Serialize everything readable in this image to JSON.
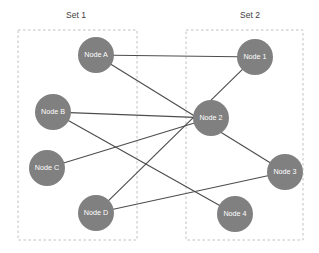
{
  "diagram": {
    "background_color": "#ffffff",
    "node_color": "#808080",
    "node_label_color": "#ffffff",
    "edge_color": "#4d4d4d",
    "box_border_color": "#c0c0c0",
    "set_label_color": "#404040"
  },
  "groups": [
    {
      "id": "set1",
      "label": "Set 1",
      "label_x": 76,
      "label_y": 16,
      "box": {
        "x": 18,
        "y": 30,
        "width": 119,
        "height": 210
      }
    },
    {
      "id": "set2",
      "label": "Set 2",
      "label_x": 250,
      "label_y": 16,
      "box": {
        "x": 186,
        "y": 30,
        "width": 117,
        "height": 210
      }
    }
  ],
  "nodes": [
    {
      "id": "A",
      "label": "Node A",
      "x": 96,
      "y": 55,
      "r": 18,
      "group": "set1"
    },
    {
      "id": "B",
      "label": "Node B",
      "x": 53,
      "y": 112,
      "r": 18,
      "group": "set1"
    },
    {
      "id": "C",
      "label": "Node C",
      "x": 47,
      "y": 168,
      "r": 18,
      "group": "set1"
    },
    {
      "id": "D",
      "label": "Node D",
      "x": 96,
      "y": 213,
      "r": 18,
      "group": "set1"
    },
    {
      "id": "1",
      "label": "Node 1",
      "x": 255,
      "y": 57,
      "r": 18,
      "group": "set2"
    },
    {
      "id": "2",
      "label": "Node 2",
      "x": 211,
      "y": 118,
      "r": 18,
      "group": "set2"
    },
    {
      "id": "3",
      "label": "Node 3",
      "x": 285,
      "y": 172,
      "r": 18,
      "group": "set2"
    },
    {
      "id": "4",
      "label": "Node 4",
      "x": 235,
      "y": 214,
      "r": 18,
      "group": "set2"
    }
  ],
  "edges": [
    {
      "id": "A-1",
      "source": "A",
      "target": "1",
      "x1": 96,
      "y1": 55,
      "x2": 255,
      "y2": 57
    },
    {
      "id": "A-3",
      "source": "A",
      "target": "3",
      "x1": 96,
      "y1": 55,
      "x2": 285,
      "y2": 172
    },
    {
      "id": "B-2",
      "source": "B",
      "target": "2",
      "x1": 53,
      "y1": 112,
      "x2": 211,
      "y2": 118
    },
    {
      "id": "B-4",
      "source": "B",
      "target": "4",
      "x1": 53,
      "y1": 112,
      "x2": 235,
      "y2": 214
    },
    {
      "id": "C-2",
      "source": "C",
      "target": "2",
      "x1": 47,
      "y1": 168,
      "x2": 211,
      "y2": 118
    },
    {
      "id": "D-1",
      "source": "D",
      "target": "1",
      "x1": 96,
      "y1": 213,
      "x2": 255,
      "y2": 57
    },
    {
      "id": "D-3",
      "source": "D",
      "target": "3",
      "x1": 96,
      "y1": 213,
      "x2": 285,
      "y2": 172
    }
  ]
}
